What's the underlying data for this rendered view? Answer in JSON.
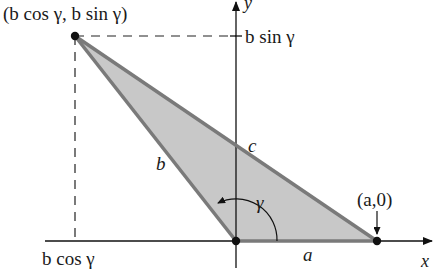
{
  "diagram": {
    "colors": {
      "triangle_fill": "#c8c8c8",
      "triangle_edge": "#7a7a7a",
      "axis": "#111111",
      "text": "#1a1a1a"
    },
    "points": {
      "top_vertex": {
        "label": "(b cos γ, b sin γ)"
      },
      "origin": {
        "label": ""
      },
      "a_point": {
        "label": "(a,0)"
      }
    },
    "sides": {
      "a": "a",
      "b": "b",
      "c": "c"
    },
    "angle": {
      "label": "γ"
    },
    "axes": {
      "x_label": "x",
      "y_label": "y"
    },
    "ticks": {
      "y_tick": "b sin γ",
      "x_tick": "b cos γ"
    }
  }
}
